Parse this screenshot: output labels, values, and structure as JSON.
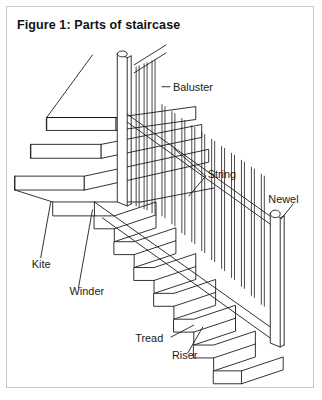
{
  "figure": {
    "title": "Figure 1: Parts of staircase",
    "caption_prefix": "Figure 1",
    "border_color": "#c9c9c9",
    "background_color": "#ffffff",
    "line_color": "#1a1a1a"
  },
  "labels": {
    "baluster": "Baluster",
    "string": "String",
    "newel": "Newel",
    "kite": "Kite",
    "winder": "Winder",
    "tread": "Tread",
    "riser": "Riser"
  },
  "diagram": {
    "type": "technical-line-drawing",
    "view": "isometric",
    "parts_labeled": 7,
    "straight_flight_steps": 9,
    "winder_steps": 3,
    "newel_posts": 2,
    "handrail": "single raking handrail from top newel to bottom newel",
    "balusters_count": 22
  }
}
